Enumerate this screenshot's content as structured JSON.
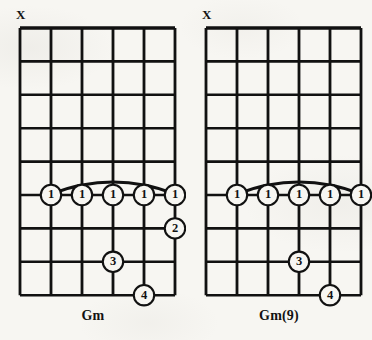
{
  "page": {
    "background_color": "#f7f6f2",
    "ink_color": "#111111",
    "width": 372,
    "height": 340
  },
  "diagrams": [
    {
      "name": "Gm",
      "chord_label": "Gm",
      "mute_marker": "X",
      "mute_string": 1,
      "strings": 6,
      "frets": 8,
      "barre": {
        "finger": "1",
        "fret": 5,
        "from_string": 2,
        "to_string": 6,
        "label": "barre"
      },
      "fingerings": [
        {
          "finger": "1",
          "string": 2,
          "fret": 5
        },
        {
          "finger": "1",
          "string": 3,
          "fret": 5
        },
        {
          "finger": "1",
          "string": 4,
          "fret": 5
        },
        {
          "finger": "1",
          "string": 5,
          "fret": 5
        },
        {
          "finger": "1",
          "string": 6,
          "fret": 5
        },
        {
          "finger": "2",
          "string": 6,
          "fret": 6
        },
        {
          "finger": "3",
          "string": 4,
          "fret": 7
        },
        {
          "finger": "4",
          "string": 5,
          "fret": 8
        }
      ]
    },
    {
      "name": "Gm(9)",
      "chord_label": "Gm(9)",
      "mute_marker": "X",
      "mute_string": 1,
      "strings": 6,
      "frets": 8,
      "barre": {
        "finger": "1",
        "fret": 5,
        "from_string": 2,
        "to_string": 6,
        "label": "barre"
      },
      "fingerings": [
        {
          "finger": "1",
          "string": 2,
          "fret": 5
        },
        {
          "finger": "1",
          "string": 3,
          "fret": 5
        },
        {
          "finger": "1",
          "string": 4,
          "fret": 5
        },
        {
          "finger": "1",
          "string": 5,
          "fret": 5
        },
        {
          "finger": "1",
          "string": 6,
          "fret": 5
        },
        {
          "finger": "3",
          "string": 4,
          "fret": 7
        },
        {
          "finger": "4",
          "string": 5,
          "fret": 8
        }
      ]
    }
  ],
  "geometry": {
    "grid_left": 20,
    "grid_top": 28,
    "string_spacing": 31,
    "fret_spacing": 33.4
  }
}
